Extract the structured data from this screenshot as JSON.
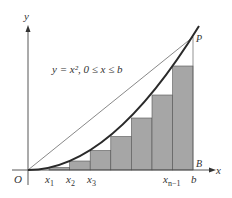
{
  "diagram": {
    "axis_x_label": "x",
    "axis_y_label": "y",
    "origin_label": "O",
    "equation_label": "y = x², 0 ≤ x ≤ b",
    "point_p_label": "P",
    "point_b_label": "B",
    "tick_labels": [
      {
        "text": "x",
        "sub": "1",
        "x": 49
      },
      {
        "text": "x",
        "sub": "2",
        "x": 69
      },
      {
        "text": "x",
        "sub": "3",
        "x": 90
      },
      {
        "text": "x",
        "sub": "n−1",
        "x": 152
      },
      {
        "text": "b",
        "sub": "",
        "x": 193
      }
    ],
    "colors": {
      "bar_fill": "#a6a6a6",
      "curve": "#2a2a2a",
      "axis": "#444444"
    }
  }
}
